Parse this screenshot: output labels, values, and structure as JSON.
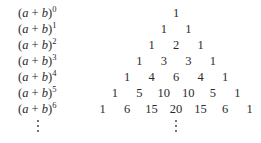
{
  "rows": [
    {
      "label_base": "(a + b)",
      "exponent": "0",
      "values": [
        "1"
      ]
    },
    {
      "label_base": "(a + b)",
      "exponent": "1",
      "values": [
        "1",
        "1"
      ]
    },
    {
      "label_base": "(a + b)",
      "exponent": "2",
      "values": [
        "1",
        "2",
        "1"
      ]
    },
    {
      "label_base": "(a + b)",
      "exponent": "3",
      "values": [
        "1",
        "3",
        "3",
        "1"
      ]
    },
    {
      "label_base": "(a + b)",
      "exponent": "4",
      "values": [
        "1",
        "4",
        "6",
        "4",
        "1"
      ]
    },
    {
      "label_base": "(a + b)",
      "exponent": "5",
      "values": [
        "1",
        "5",
        "10",
        "10",
        "5",
        "1"
      ]
    },
    {
      "label_base": "(a + b)",
      "exponent": "6",
      "values": [
        "1",
        "6",
        "15",
        "20",
        "15",
        "6",
        "1"
      ]
    }
  ],
  "continuation": "vertical-ellipsis"
}
